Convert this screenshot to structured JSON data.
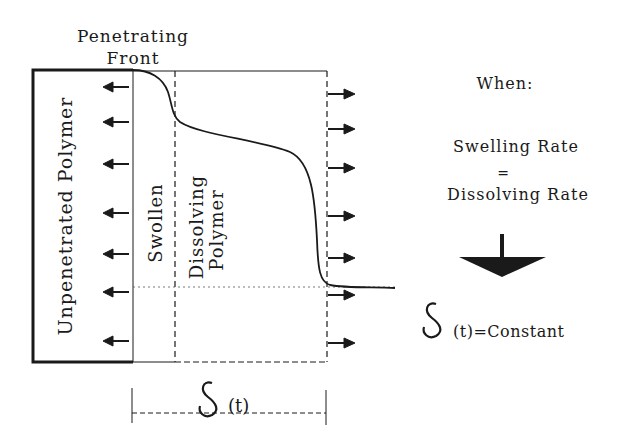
{
  "title_label": {
    "line1": "Penetrating",
    "line2": "Front"
  },
  "regions": {
    "unpenetrated": "Unpenetrated Polymer",
    "swollen": "Swollen",
    "dissolving_line1": "Dissolving",
    "dissolving_line2": "Polymer"
  },
  "delta_label": {
    "symbol": "δ",
    "arg": "(t)"
  },
  "condition": {
    "when": "When:",
    "line1": "Swelling Rate",
    "equals": "=",
    "line2": "Dissolving Rate",
    "result_symbol": "δ",
    "result_text": "(t)=Constant"
  },
  "colors": {
    "ink": "#1a1a1a",
    "background": "#ffffff"
  }
}
